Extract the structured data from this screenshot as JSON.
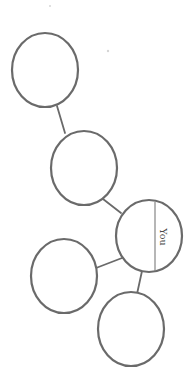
{
  "diagram": {
    "type": "family-tree / relationship web",
    "colors": {
      "stroke": "#6a6a6a",
      "divider": "#7a7a7a",
      "label": "#4a4a4a",
      "background": "#ffffff"
    },
    "nodes": [
      {
        "id": "node-1",
        "cx": 45,
        "cy": 70,
        "rx": 33,
        "ry": 37,
        "label": ""
      },
      {
        "id": "node-2",
        "cx": 84,
        "cy": 168,
        "rx": 33,
        "ry": 37,
        "label": ""
      },
      {
        "id": "node-you",
        "cx": 149,
        "cy": 236,
        "rx": 33,
        "ry": 36,
        "label": "You"
      },
      {
        "id": "node-4",
        "cx": 64,
        "cy": 276,
        "rx": 33,
        "ry": 37,
        "label": ""
      },
      {
        "id": "node-5",
        "cx": 131,
        "cy": 329,
        "rx": 33,
        "ry": 37,
        "label": ""
      }
    ],
    "edges": [
      {
        "from": "node-1",
        "to": "node-2"
      },
      {
        "from": "node-2",
        "to": "node-you"
      },
      {
        "from": "node-you",
        "to": "node-4"
      },
      {
        "from": "node-you",
        "to": "node-5"
      }
    ],
    "you_label": "You"
  }
}
